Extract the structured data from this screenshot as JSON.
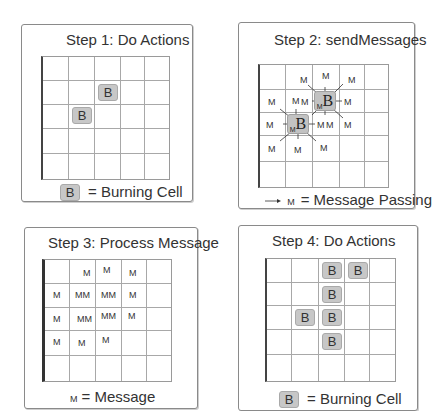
{
  "panels": [
    {
      "id": "step1",
      "title": "Step 1: Do Actions",
      "grid": {
        "rows": 5,
        "cols": 5
      },
      "burning_cells": [
        [
          1,
          2
        ],
        [
          2,
          1
        ]
      ],
      "cell_label": "B",
      "legend": {
        "symbol": "B",
        "text": "= Burning Cell"
      }
    },
    {
      "id": "step2",
      "title": "Step 2: sendMessages",
      "grid": {
        "rows": 5,
        "cols": 5
      },
      "burning_cells": [
        [
          1,
          2
        ],
        [
          2,
          1
        ]
      ],
      "cell_label": "B",
      "cell_sub_label": "M",
      "message_label": "M",
      "legend": {
        "symbol": "M",
        "text": "= Message Passing"
      }
    },
    {
      "id": "step3",
      "title": "Step 3: Process Message",
      "grid": {
        "rows": 5,
        "cols": 5
      },
      "messages": [
        {
          "row": 0,
          "col": 1,
          "text": "M"
        },
        {
          "row": 0,
          "col": 2,
          "text": "M"
        },
        {
          "row": 0,
          "col": 3,
          "text": "M"
        },
        {
          "row": 1,
          "col": 0,
          "text": "M"
        },
        {
          "row": 1,
          "col": 1,
          "text": "MM"
        },
        {
          "row": 1,
          "col": 2,
          "text": "MM"
        },
        {
          "row": 1,
          "col": 3,
          "text": "M"
        },
        {
          "row": 2,
          "col": 0,
          "text": "M"
        },
        {
          "row": 2,
          "col": 1,
          "text": "MM"
        },
        {
          "row": 2,
          "col": 2,
          "text": "MM"
        },
        {
          "row": 2,
          "col": 3,
          "text": "M"
        },
        {
          "row": 3,
          "col": 0,
          "text": "M"
        },
        {
          "row": 3,
          "col": 1,
          "text": "M"
        },
        {
          "row": 3,
          "col": 2,
          "text": "M"
        }
      ],
      "legend": {
        "symbol": "M",
        "text": "= Message"
      }
    },
    {
      "id": "step4",
      "title": "Step 4: Do Actions",
      "grid": {
        "rows": 5,
        "cols": 5
      },
      "burning_cells": [
        [
          0,
          2
        ],
        [
          0,
          3
        ],
        [
          1,
          2
        ],
        [
          2,
          1
        ],
        [
          2,
          2
        ],
        [
          3,
          2
        ]
      ],
      "cell_label": "B",
      "legend": {
        "symbol": "B",
        "text": "= Burning Cell"
      }
    }
  ],
  "colors": {
    "burning_cell_fill": "#c7c7c7",
    "grid_line": "#a8a8a8",
    "panel_border": "#8a8a8a"
  }
}
